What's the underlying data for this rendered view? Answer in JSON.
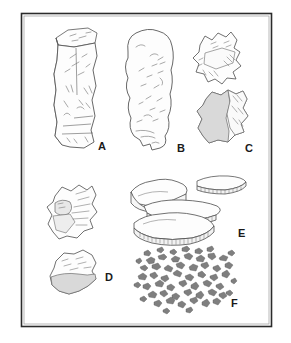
{
  "figure": {
    "type": "scientific-illustration-plate",
    "background_color": "#ffffff",
    "border": {
      "color": "#2b2b2b",
      "style": "double-rule-rectangle",
      "x": 21,
      "y": 13,
      "width": 251,
      "height": 314
    },
    "line_color": "#555555",
    "fill_color": "#fdfdfd",
    "shade_color": "#d9d9d9",
    "debris_color": "#7f7f7f"
  },
  "specimens": [
    {
      "id": "A",
      "label": "A",
      "label_x": 98,
      "label_y": 150,
      "description": "prismatic blade core with flat striking platform",
      "pieces": 1
    },
    {
      "id": "B",
      "label": "B",
      "label_x": 177,
      "label_y": 152,
      "description": "elongated nodule core with irregular flake scars",
      "pieces": 1
    },
    {
      "id": "C",
      "label": "C",
      "label_x": 245,
      "label_y": 152,
      "description": "two angular core fragments, lower one shaded",
      "pieces": 2
    },
    {
      "id": "D",
      "label": "D",
      "label_x": 105,
      "label_y": 281,
      "description": "two angular flakes, lower one with shaded base",
      "pieces": 2
    },
    {
      "id": "E",
      "label": "E",
      "label_x": 238,
      "label_y": 237,
      "description": "stacked tabular slabs with hatched striated edges",
      "pieces": 4
    },
    {
      "id": "F",
      "label": "F",
      "label_x": 231,
      "label_y": 307,
      "description": "scatter of small angular debitage fragments",
      "pieces": 58
    }
  ]
}
